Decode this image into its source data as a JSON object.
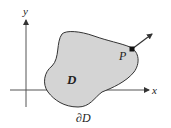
{
  "diagram": {
    "axes": {
      "x_label": "x",
      "y_label": "y"
    },
    "region": {
      "label": "D",
      "boundary_label": "∂D",
      "fill_color": "#d4d4d4",
      "stroke_color": "#333333"
    },
    "point": {
      "label": "P",
      "description": "point on boundary with outward normal arrow"
    }
  }
}
